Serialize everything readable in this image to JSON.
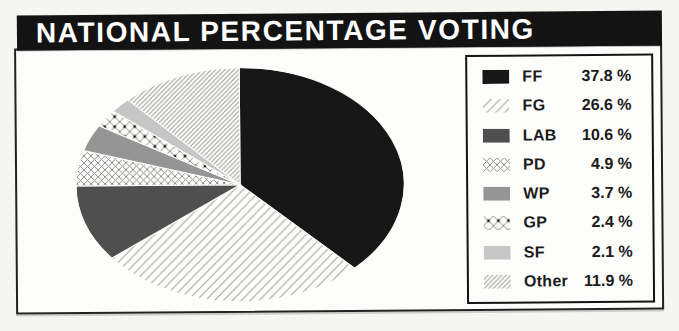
{
  "title_bar": {
    "text": "NATIONAL PERCENTAGE VOTING"
  },
  "palette": {
    "title_bar_bg": "#131313",
    "title_text": "#ffffff",
    "paper_bg": "#f5f5f2",
    "panel_bg": "#fdfdfb",
    "border": "#222222"
  },
  "chart_data": {
    "type": "pie",
    "title": "NATIONAL PERCENTAGE VOTING",
    "unit": "%",
    "start_angle_deg": 0,
    "direction": "clockwise",
    "legend_position": "right",
    "total": 100.0,
    "series": [
      {
        "label": "FF",
        "value": 37.8,
        "display": "37.8 %",
        "swatch": "solid",
        "color": "#171717"
      },
      {
        "label": "FG",
        "value": 26.6,
        "display": "26.6 %",
        "swatch": "diag-sparse",
        "color": "#a8a8a8"
      },
      {
        "label": "LAB",
        "value": 10.6,
        "display": "10.6 %",
        "swatch": "solid",
        "color": "#4f4f4f"
      },
      {
        "label": "PD",
        "value": 4.9,
        "display": "4.9 %",
        "swatch": "lattice",
        "color": "#8f8f8f"
      },
      {
        "label": "WP",
        "value": 3.7,
        "display": "3.7 %",
        "swatch": "solid",
        "color": "#959595"
      },
      {
        "label": "GP",
        "value": 2.4,
        "display": "2.4 %",
        "swatch": "lattice-dot",
        "color": "#8f8f8f"
      },
      {
        "label": "SF",
        "value": 2.1,
        "display": "2.1 %",
        "swatch": "solid",
        "color": "#c6c6c6"
      },
      {
        "label": "Other",
        "value": 11.9,
        "display": "11.9 %",
        "swatch": "diag-dense",
        "color": "#9a9a9a"
      }
    ]
  }
}
